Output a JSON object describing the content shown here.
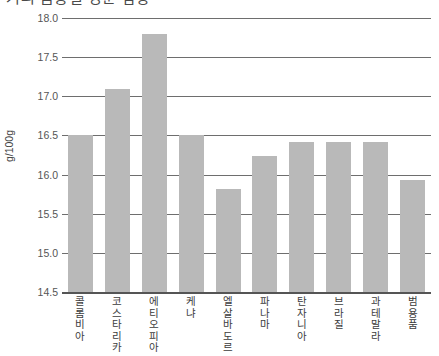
{
  "title": "커피 품종별 성분 함량",
  "chart_data": {
    "type": "bar",
    "title": "커피 품종별 성분 함량",
    "xlabel": "",
    "ylabel": "g/100g",
    "ylim": [
      14.5,
      18.0
    ],
    "yticks": [
      "14.5",
      "15.0",
      "15.5",
      "16.0",
      "16.5",
      "17.0",
      "17.5",
      "18.0"
    ],
    "ytick_values": [
      14.5,
      15.0,
      15.5,
      16.0,
      16.5,
      17.0,
      17.5,
      18.0
    ],
    "grid": true,
    "legend": "none",
    "bar_color": "#b9b9b9",
    "categories": [
      "콜롬비아",
      "코스타리카",
      "에티오피아",
      "케냐",
      "엘살바도르",
      "파나마",
      "탄자니아",
      "브라질",
      "과테말라",
      "범용품"
    ],
    "values": [
      16.5,
      17.09,
      17.8,
      16.5,
      15.81,
      16.24,
      16.42,
      16.42,
      16.42,
      15.93
    ]
  }
}
